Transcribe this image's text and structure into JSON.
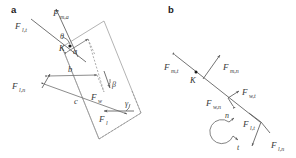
{
  "figure": {
    "type": "free-body-force-diagram",
    "background": "#ffffff",
    "line_color": "#6e6e6e",
    "text_color": "#3a3a3a",
    "panels": [
      {
        "id": "a",
        "label": "a",
        "description": "Forces and lever arms about joint K",
        "forces": [
          {
            "name": "F_l,t",
            "base": "F",
            "sub": "l,t"
          },
          {
            "name": "F_m,a",
            "base": "F",
            "sub": "m,a"
          },
          {
            "name": "F_l,n",
            "base": "F",
            "sub": "l,n"
          },
          {
            "name": "F_w",
            "base": "F",
            "sub": "w"
          },
          {
            "name": "F_l",
            "base": "F",
            "sub": "l"
          }
        ],
        "lever_arms": [
          "a",
          "b",
          "c"
        ],
        "angles": [
          "θ",
          "β",
          "γ"
        ],
        "points": [
          "K"
        ]
      },
      {
        "id": "b",
        "label": "b",
        "description": "Tangential and normal force components along the segment axis",
        "forces": [
          {
            "name": "F_m,t",
            "base": "F",
            "sub": "m,t"
          },
          {
            "name": "F_m,n",
            "base": "F",
            "sub": "m,n"
          },
          {
            "name": "F_w,t",
            "base": "F",
            "sub": "w,t"
          },
          {
            "name": "F_w,n",
            "base": "F",
            "sub": "w,n"
          },
          {
            "name": "F_l,t",
            "base": "F",
            "sub": "l,t"
          },
          {
            "name": "F_l,n",
            "base": "F",
            "sub": "l,n"
          }
        ],
        "points": [
          "K"
        ],
        "axes": [
          "n",
          "t"
        ]
      }
    ]
  },
  "labels": {
    "panel_a": "a",
    "panel_b": "b",
    "F": "F",
    "sub_lt": "l,t",
    "sub_ma": "m,a",
    "sub_ln": "l,n",
    "sub_w": "w",
    "sub_l": "l",
    "sub_mt": "m,t",
    "sub_mn": "m,n",
    "sub_wt": "w,t",
    "sub_wn": "w,n",
    "arm_a": "a",
    "arm_b": "b",
    "arm_c": "c",
    "angle_theta": "θ",
    "angle_beta": "β",
    "angle_gamma": "γ",
    "point_K_a": "K",
    "point_K_b": "K",
    "axis_n": "n",
    "axis_t": "t"
  }
}
